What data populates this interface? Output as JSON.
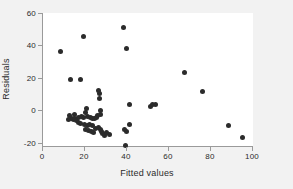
{
  "chart_data": {
    "type": "scatter",
    "title": "",
    "xlabel": "Fitted values",
    "ylabel": "Residuals",
    "xlim": [
      0,
      100
    ],
    "ylim": [
      -22,
      60
    ],
    "xticks": [
      0,
      20,
      40,
      60,
      80,
      100
    ],
    "yticks": [
      -20,
      0,
      20,
      40,
      60
    ],
    "grid": false,
    "legend": null,
    "marker_color": "#2b2b2b",
    "marker_size": 5,
    "points": [
      {
        "x": 8.5,
        "y": 36.5
      },
      {
        "x": 13.0,
        "y": 19.3
      },
      {
        "x": 17.8,
        "y": 19.2
      },
      {
        "x": 19.3,
        "y": 45.7
      },
      {
        "x": 38.3,
        "y": 51.2
      },
      {
        "x": 39.7,
        "y": 38.4
      },
      {
        "x": 67.2,
        "y": 23.5
      },
      {
        "x": 76.0,
        "y": 11.3
      },
      {
        "x": 88.2,
        "y": -9.4
      },
      {
        "x": 95.0,
        "y": -16.6
      },
      {
        "x": 26.6,
        "y": 12.2
      },
      {
        "x": 27.1,
        "y": 10.2
      },
      {
        "x": 26.8,
        "y": 7.0
      },
      {
        "x": 41.0,
        "y": 3.5
      },
      {
        "x": 51.3,
        "y": 2.6
      },
      {
        "x": 52.0,
        "y": 3.4
      },
      {
        "x": 53.4,
        "y": 3.7
      },
      {
        "x": 20.9,
        "y": 1.0
      },
      {
        "x": 20.2,
        "y": -1.4
      },
      {
        "x": 27.4,
        "y": -0.4
      },
      {
        "x": 27.6,
        "y": -2.6
      },
      {
        "x": 26.1,
        "y": -3.0
      },
      {
        "x": 14.9,
        "y": -2.4
      },
      {
        "x": 12.8,
        "y": -3.4
      },
      {
        "x": 13.6,
        "y": -4.8
      },
      {
        "x": 14.4,
        "y": -5.4
      },
      {
        "x": 15.2,
        "y": -5.0
      },
      {
        "x": 12.2,
        "y": -5.6
      },
      {
        "x": 16.0,
        "y": -6.2
      },
      {
        "x": 17.0,
        "y": -4.6
      },
      {
        "x": 18.3,
        "y": -3.8
      },
      {
        "x": 19.2,
        "y": -4.2
      },
      {
        "x": 21.4,
        "y": -4.0
      },
      {
        "x": 22.6,
        "y": -4.4
      },
      {
        "x": 23.6,
        "y": -4.9
      },
      {
        "x": 24.6,
        "y": -5.2
      },
      {
        "x": 25.4,
        "y": -4.2
      },
      {
        "x": 16.8,
        "y": -7.6
      },
      {
        "x": 18.0,
        "y": -8.2
      },
      {
        "x": 19.6,
        "y": -8.8
      },
      {
        "x": 21.0,
        "y": -9.4
      },
      {
        "x": 22.2,
        "y": -8.6
      },
      {
        "x": 23.4,
        "y": -9.2
      },
      {
        "x": 20.4,
        "y": -11.6
      },
      {
        "x": 21.8,
        "y": -12.4
      },
      {
        "x": 23.0,
        "y": -13.0
      },
      {
        "x": 24.2,
        "y": -13.6
      },
      {
        "x": 25.2,
        "y": -11.4
      },
      {
        "x": 26.4,
        "y": -10.4
      },
      {
        "x": 27.2,
        "y": -11.8
      },
      {
        "x": 27.8,
        "y": -13.2
      },
      {
        "x": 28.4,
        "y": -14.6
      },
      {
        "x": 29.2,
        "y": -15.4
      },
      {
        "x": 31.6,
        "y": -15.2
      },
      {
        "x": 30.4,
        "y": -13.8
      },
      {
        "x": 39.0,
        "y": -11.6
      },
      {
        "x": 39.6,
        "y": -13.0
      },
      {
        "x": 41.3,
        "y": -9.0
      },
      {
        "x": 39.3,
        "y": -21.6
      }
    ]
  }
}
